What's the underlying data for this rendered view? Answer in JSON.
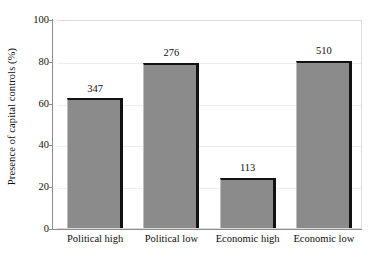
{
  "chart_data": {
    "type": "bar",
    "title": "",
    "subtitle": "",
    "xlabel": "",
    "ylabel": "Presence of capital controls (%)",
    "categories": [
      "Political high",
      "Political low",
      "Economic high",
      "Economic low"
    ],
    "values": [
      62,
      79,
      24,
      80
    ],
    "point_labels": [
      "347",
      "276",
      "113",
      "510"
    ],
    "point_label_meaning": "sample size (n) printed above each bar",
    "ylim": [
      0,
      100
    ],
    "y_ticks": [
      0,
      20,
      40,
      60,
      80,
      100
    ],
    "y_tick_labels": [
      "0",
      "20",
      "40",
      "60",
      "80",
      "100"
    ],
    "grid": "horizontal gridlines at 20, 40, 60, 80",
    "legend": "none",
    "legend_position": "none",
    "bar_fill_color": "#8b8b8b",
    "bar_edge_color": "#121212",
    "plot_border_color": "#dcdcdc",
    "axis_color": "#8c8c8c",
    "gridline_color": "#ededed",
    "text_color": "#101010",
    "background_color": "#ffffff"
  }
}
